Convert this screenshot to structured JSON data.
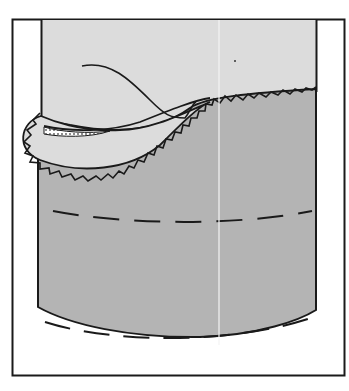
{
  "figure": {
    "colors": {
      "background": "#ffffff",
      "frame": "#1a1a1a",
      "light_fabric": "#dcdcdc",
      "dark_fabric": "#b4b4b4",
      "stitch": "#1a1a1a",
      "fold_line": "#f4f4f4"
    },
    "elements": [
      "outer-frame",
      "garment-fabric",
      "hem-facing",
      "zigzag-edge",
      "thread",
      "stitching-line-middle",
      "stitching-line-bottom",
      "interfacing-dots"
    ]
  }
}
